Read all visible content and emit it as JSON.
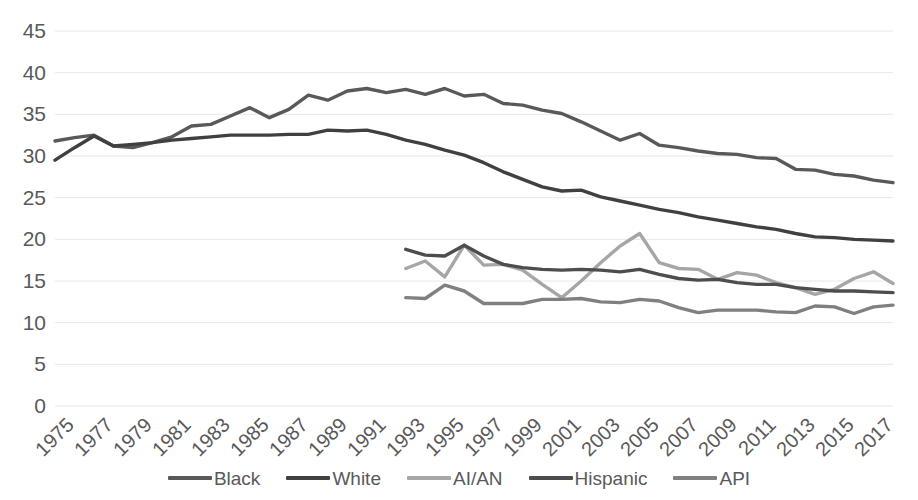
{
  "chart_data": {
    "type": "line",
    "title": "",
    "subtitle": "",
    "xlabel": "",
    "ylabel": "",
    "xlim": [
      1975,
      2018
    ],
    "ylim": [
      0,
      45
    ],
    "y_ticks": [
      0,
      5,
      10,
      15,
      20,
      25,
      30,
      35,
      40,
      45
    ],
    "x_ticks": [
      "1975",
      "1977",
      "1979",
      "1981",
      "1983",
      "1985",
      "1987",
      "1989",
      "1991",
      "1993",
      "1995",
      "1997",
      "1999",
      "2001",
      "2003",
      "2005",
      "2007",
      "2009",
      "2011",
      "2013",
      "2015",
      "2017"
    ],
    "grid": true,
    "legend_position": "bottom",
    "x": [
      1975,
      1976,
      1977,
      1978,
      1979,
      1980,
      1981,
      1982,
      1983,
      1984,
      1985,
      1986,
      1987,
      1988,
      1989,
      1990,
      1991,
      1992,
      1993,
      1994,
      1995,
      1996,
      1997,
      1998,
      1999,
      2000,
      2001,
      2002,
      2003,
      2004,
      2005,
      2006,
      2007,
      2008,
      2009,
      2010,
      2011,
      2012,
      2013,
      2014,
      2015,
      2016,
      2017,
      2018
    ],
    "series": [
      {
        "name": "Black",
        "color": "#595959",
        "x": [
          1975,
          1976,
          1977,
          1978,
          1979,
          1980,
          1981,
          1982,
          1983,
          1984,
          1985,
          1986,
          1987,
          1988,
          1989,
          1990,
          1991,
          1992,
          1993,
          1994,
          1995,
          1996,
          1997,
          1998,
          1999,
          2000,
          2001,
          2002,
          2003,
          2004,
          2005,
          2006,
          2007,
          2008,
          2009,
          2010,
          2011,
          2012,
          2013,
          2014,
          2015,
          2016,
          2017,
          2018
        ],
        "values": [
          31.8,
          32.2,
          32.5,
          31.2,
          31.0,
          31.6,
          32.3,
          33.6,
          33.8,
          34.8,
          35.8,
          34.6,
          35.6,
          37.3,
          36.7,
          37.8,
          38.1,
          37.6,
          38.0,
          37.4,
          38.1,
          37.2,
          37.4,
          36.3,
          36.1,
          35.5,
          35.1,
          34.1,
          33.0,
          31.9,
          32.7,
          31.3,
          31.0,
          30.6,
          30.3,
          30.2,
          29.8,
          29.7,
          28.4,
          28.3,
          27.8,
          27.6,
          27.1,
          26.8
        ]
      },
      {
        "name": "White",
        "color": "#404040",
        "x": [
          1975,
          1976,
          1977,
          1978,
          1979,
          1980,
          1981,
          1982,
          1983,
          1984,
          1985,
          1986,
          1987,
          1988,
          1989,
          1990,
          1991,
          1992,
          1993,
          1994,
          1995,
          1996,
          1997,
          1998,
          1999,
          2000,
          2001,
          2002,
          2003,
          2004,
          2005,
          2006,
          2007,
          2008,
          2009,
          2010,
          2011,
          2012,
          2013,
          2014,
          2015,
          2016,
          2017,
          2018
        ],
        "values": [
          29.5,
          31.0,
          32.4,
          31.2,
          31.4,
          31.6,
          31.9,
          32.1,
          32.3,
          32.5,
          32.5,
          32.5,
          32.6,
          32.6,
          33.1,
          33.0,
          33.1,
          32.6,
          31.9,
          31.4,
          30.7,
          30.1,
          29.2,
          28.1,
          27.2,
          26.3,
          25.8,
          25.9,
          25.1,
          24.6,
          24.1,
          23.6,
          23.2,
          22.7,
          22.3,
          21.9,
          21.5,
          21.2,
          20.7,
          20.3,
          20.2,
          20.0,
          19.9,
          19.8
        ]
      },
      {
        "name": "AI/AN",
        "color": "#a6a6a6",
        "x": [
          1993,
          1994,
          1995,
          1996,
          1997,
          1998,
          1999,
          2000,
          2001,
          2002,
          2003,
          2004,
          2005,
          2006,
          2007,
          2008,
          2009,
          2010,
          2011,
          2012,
          2013,
          2014,
          2015,
          2016,
          2017,
          2018
        ],
        "values": [
          16.5,
          17.4,
          15.5,
          19.3,
          16.9,
          17.0,
          16.3,
          14.6,
          13.0,
          15.0,
          17.2,
          19.2,
          20.7,
          17.2,
          16.5,
          16.4,
          15.2,
          16.0,
          15.7,
          14.8,
          14.2,
          13.4,
          14.0,
          15.3,
          16.1,
          14.7
        ]
      },
      {
        "name": "Hispanic",
        "color": "#4d4d4d",
        "x": [
          1993,
          1994,
          1995,
          1996,
          1997,
          1998,
          1999,
          2000,
          2001,
          2002,
          2003,
          2004,
          2005,
          2006,
          2007,
          2008,
          2009,
          2010,
          2011,
          2012,
          2013,
          2014,
          2015,
          2016,
          2017,
          2018
        ],
        "values": [
          18.8,
          18.1,
          18.0,
          19.3,
          18.0,
          17.0,
          16.6,
          16.4,
          16.3,
          16.4,
          16.3,
          16.1,
          16.4,
          15.8,
          15.3,
          15.1,
          15.2,
          14.8,
          14.6,
          14.6,
          14.2,
          14.0,
          13.8,
          13.8,
          13.7,
          13.6
        ]
      },
      {
        "name": "API",
        "color": "#808080",
        "x": [
          1993,
          1994,
          1995,
          1996,
          1997,
          1998,
          1999,
          2000,
          2001,
          2002,
          2003,
          2004,
          2005,
          2006,
          2007,
          2008,
          2009,
          2010,
          2011,
          2012,
          2013,
          2014,
          2015,
          2016,
          2017,
          2018
        ],
        "values": [
          13.0,
          12.9,
          14.5,
          13.8,
          12.3,
          12.3,
          12.3,
          12.8,
          12.8,
          12.9,
          12.5,
          12.4,
          12.8,
          12.6,
          11.8,
          11.2,
          11.5,
          11.5,
          11.5,
          11.3,
          11.2,
          12.0,
          11.9,
          11.1,
          11.9,
          12.1
        ]
      }
    ]
  },
  "legend": {
    "items": [
      {
        "label": "Black",
        "color": "#595959"
      },
      {
        "label": "White",
        "color": "#404040"
      },
      {
        "label": "AI/AN",
        "color": "#a6a6a6"
      },
      {
        "label": "Hispanic",
        "color": "#4d4d4d"
      },
      {
        "label": "API",
        "color": "#808080"
      }
    ]
  },
  "colors": {
    "grid": "#e8e8e8",
    "text": "#595959",
    "background": "#ffffff"
  }
}
